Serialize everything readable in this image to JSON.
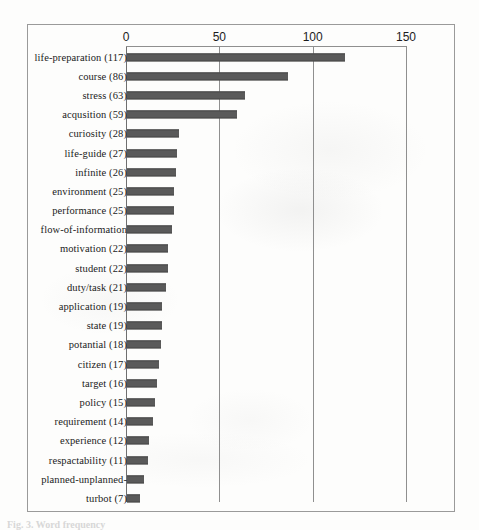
{
  "figure": {
    "caption": "Fig. 3. Word frequency",
    "frame_color": "#9a9a9a",
    "bar_color": "#5a5a5a",
    "gridline_color": "#8f8f8f"
  },
  "chart_data": {
    "type": "bar",
    "orientation": "horizontal",
    "title": "",
    "subtitle": "",
    "xlabel": "",
    "ylabel": "",
    "xlim": [
      0,
      160
    ],
    "grid": true,
    "legend": false,
    "xticks": [
      "0",
      "50",
      "100",
      "150"
    ],
    "xtick_values": [
      0,
      50,
      100,
      150
    ],
    "categories": [
      "life-preparation (117)",
      "course (86)",
      "stress (63)",
      "acqusition (59)",
      "curiosity (28)",
      "life-guide (27)",
      "infinite (26)",
      "environment (25)",
      "performance (25)",
      "flow-of-information",
      "motivation (22)",
      "student (22)",
      "duty/task (21)",
      "application (19)",
      "state (19)",
      "potantial (18)",
      "citizen (17)",
      "target (16)",
      "policy (15)",
      "requirement (14)",
      "experience (12)",
      "respactability (11)",
      "planned-unplanned-",
      "turbot (7)"
    ],
    "values": [
      117,
      86,
      63,
      59,
      28,
      27,
      26,
      25,
      25,
      24,
      22,
      22,
      21,
      19,
      19,
      18,
      17,
      16,
      15,
      14,
      12,
      11,
      9,
      7
    ],
    "value_labels": [
      "117",
      "86",
      "63",
      "59",
      "28",
      "27",
      "26",
      "25",
      "25",
      "",
      "22",
      "22",
      "21",
      "19",
      "19",
      "18",
      "17",
      "16",
      "15",
      "14",
      "12",
      "11",
      "",
      "7"
    ]
  }
}
